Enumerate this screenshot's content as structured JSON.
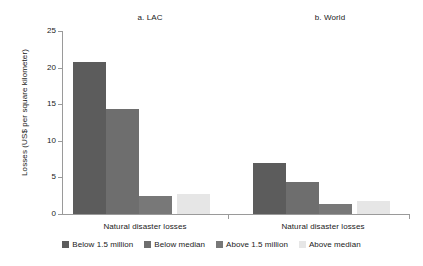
{
  "chart_data": {
    "type": "bar",
    "title": "",
    "xlabel": "",
    "ylabel": "Losses (US$ per square kilometer)",
    "ylim": [
      0,
      25
    ],
    "yticks": [
      0,
      5,
      10,
      15,
      20,
      25
    ],
    "ytick_labels": [
      "0",
      "5",
      "10",
      "15",
      "20",
      "25"
    ],
    "grid": false,
    "legend_position": "bottom",
    "panels": [
      {
        "title": "a. LAC",
        "category": "Natural disaster losses",
        "values": [
          20.8,
          14.4,
          2.5,
          2.8
        ]
      },
      {
        "title": "b. World",
        "category": "Natural disaster losses",
        "values": [
          7.0,
          4.4,
          1.4,
          1.8
        ]
      }
    ],
    "series": [
      {
        "name": "Below 1.5 million",
        "color": "#5c5c5c",
        "values": [
          20.8,
          7.0
        ]
      },
      {
        "name": "Below median",
        "color": "#6e6e6e",
        "values": [
          14.4,
          4.4
        ]
      },
      {
        "name": "Above 1.5 million",
        "color": "#787878",
        "values": [
          2.5,
          1.4
        ]
      },
      {
        "name": "Above median",
        "color": "#e6e6e6",
        "values": [
          2.8,
          1.8
        ]
      }
    ],
    "categories": [
      "a. LAC",
      "b. World"
    ]
  },
  "legend": {
    "items": [
      {
        "label": "Below 1.5 million",
        "color": "#5c5c5c"
      },
      {
        "label": "Below median",
        "color": "#6e6e6e"
      },
      {
        "label": "Above 1.5 million",
        "color": "#787878"
      },
      {
        "label": "Above median",
        "color": "#e6e6e6"
      }
    ]
  },
  "axis": {
    "y_label": "Losses (US$ per square kilometer)",
    "y_ticks": [
      "25",
      "20",
      "15",
      "10",
      "5",
      "0"
    ],
    "line_color": "#9a9a9a"
  },
  "panels": {
    "lac": {
      "title": "a. LAC",
      "x_label": "Natural disaster losses"
    },
    "world": {
      "title": "b. World",
      "x_label": "Natural disaster losses"
    }
  }
}
